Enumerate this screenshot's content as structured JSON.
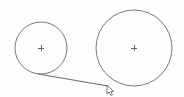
{
  "canvas": {
    "width": 184,
    "height": 97,
    "background": "#fdfdfd",
    "stroke_color": "#7a7a7a"
  },
  "shapes": {
    "circles": [
      {
        "name": "small-circle",
        "cx": 41,
        "cy": 48,
        "r": 26
      },
      {
        "name": "large-circle",
        "cx": 134,
        "cy": 48,
        "r": 38
      }
    ],
    "tangent_line": {
      "x1": 38,
      "y1": 74,
      "x2": 108,
      "y2": 86
    },
    "cursor": {
      "x": 107,
      "y": 85
    }
  }
}
